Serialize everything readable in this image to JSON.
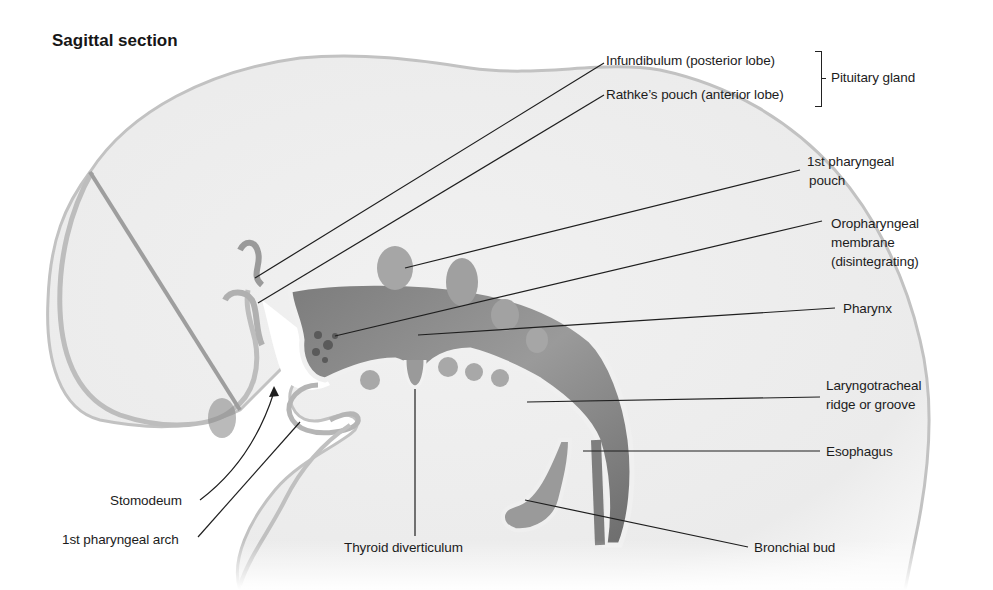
{
  "title": "Sagittal section",
  "labels": {
    "infundibulum": "Infundibulum (posterior lobe)",
    "rathke": "Rathke’s pouch (anterior lobe)",
    "pituitary": "Pituitary gland",
    "pouch_line1": "1st pharyngeal",
    "pouch_line2": "pouch",
    "oro_line1": "Oropharyngeal",
    "oro_line2": "membrane",
    "oro_line3": "(disintegrating)",
    "pharynx": "Pharynx",
    "laryngo_line1": "Laryngotracheal",
    "laryngo_line2": "ridge or groove",
    "esophagus": "Esophagus",
    "bronchial": "Bronchial bud",
    "thyroid": "Thyroid diverticulum",
    "stomodeum": "Stomodeum",
    "arch": "1st pharyngeal arch"
  },
  "colors": {
    "background": "#ffffff",
    "embryo_fill": "#eeeeee",
    "embryo_edge": "#b8b8b8",
    "gut_fill": "#8f8f8f",
    "gut_dark": "#6e6e6e",
    "leader": "#1e1e1e"
  }
}
